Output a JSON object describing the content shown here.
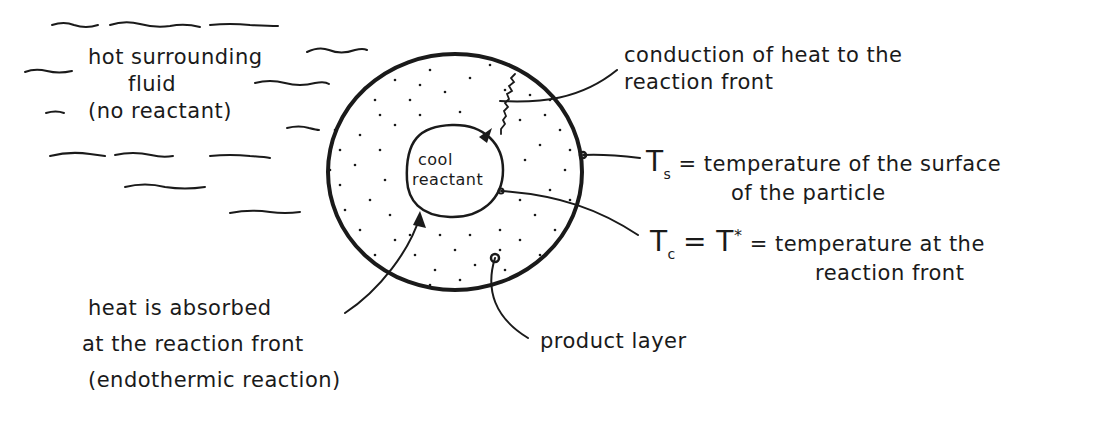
{
  "diagram": {
    "type": "shrinking-core particle schematic (endothermic reaction)",
    "colors": {
      "ink": "#1a1a1a",
      "background": "#ffffff"
    },
    "surrounding": {
      "line1": "hot surrounding",
      "line2": "fluid",
      "line3": "(no reactant)"
    },
    "core": {
      "line1": "cool",
      "line2": "reactant"
    },
    "annotations": {
      "conduction": {
        "line1": "conduction of heat to the",
        "line2": "reaction front"
      },
      "surface_temp": {
        "symbol": "T",
        "subscript": "s",
        "line1": "= temperature of the surface",
        "line2": "of the particle"
      },
      "front_temp": {
        "symbol": "T",
        "subscript": "c",
        "eq": "= T",
        "sup": "*",
        "line1": "= temperature at the",
        "line2": "reaction front"
      },
      "absorbed": {
        "line1": "heat is absorbed",
        "line2": "at the reaction front",
        "line3": "(endothermic reaction)"
      },
      "product": {
        "label": "product layer"
      }
    }
  }
}
